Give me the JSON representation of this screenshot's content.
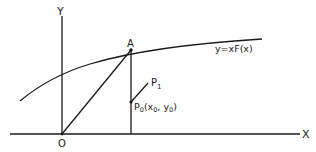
{
  "diagram": {
    "axes": {
      "x_label": "X",
      "y_label": "Y",
      "origin_label": "O"
    },
    "points": {
      "A": "A",
      "P1": "P",
      "P1_sub": "1",
      "P0": "P",
      "P0_sub": "0",
      "P0_coords": "(x",
      "P0_coords_x_sub": "0",
      "P0_coords_mid": ", y",
      "P0_coords_y_sub": "0",
      "P0_coords_end": ")"
    },
    "curve": {
      "label": "y=xF(x)"
    },
    "colors": {
      "stroke": "#1a1a1a",
      "background": "#ffffff"
    }
  }
}
